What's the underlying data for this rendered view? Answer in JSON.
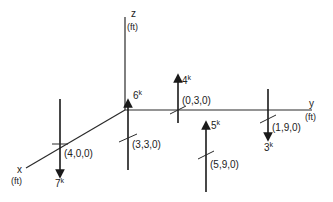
{
  "diagram": {
    "axes": {
      "x": {
        "name": "x",
        "unit": "(ft)"
      },
      "y": {
        "name": "y",
        "unit": "(ft)"
      },
      "z": {
        "name": "z",
        "unit": "(ft)"
      }
    },
    "forces": [
      {
        "id": "f1",
        "point": "(4,0,0)",
        "magnitude": "7",
        "unit": "k",
        "direction": "down"
      },
      {
        "id": "f2",
        "point": "(3,3,0)",
        "magnitude": "6",
        "unit": "k",
        "direction": "up"
      },
      {
        "id": "f3",
        "point": "(0,3,0)",
        "magnitude": "4",
        "unit": "k",
        "direction": "up"
      },
      {
        "id": "f4",
        "point": "(1,9,0)",
        "magnitude": "3",
        "unit": "k",
        "direction": "down"
      },
      {
        "id": "f5",
        "point": "(5,9,0)",
        "magnitude": "5",
        "unit": "k",
        "direction": "up"
      }
    ]
  }
}
